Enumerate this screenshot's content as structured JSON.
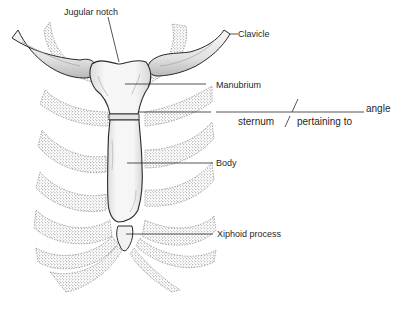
{
  "diagram": {
    "labels": {
      "jugular_notch": "Jugular notch",
      "clavicle": "Clavicle",
      "manubrium": "Manubrium",
      "body": "Body",
      "xiphoid_process": "Xiphoid process"
    },
    "fill_in": {
      "word_part_left": "sternum",
      "word_part_right": "pertaining to",
      "suffix_word": "angle"
    },
    "colors": {
      "ink": "#2a2a2a",
      "bone_fill": "#f4f4f4",
      "bone_shade": "#cfcfcf",
      "stipple": "#777777",
      "background": "#ffffff"
    }
  }
}
